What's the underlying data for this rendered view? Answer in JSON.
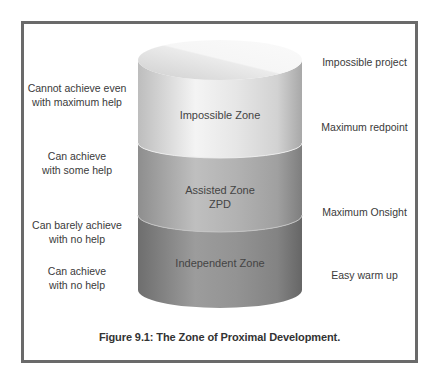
{
  "figure": {
    "caption": "Figure 9.1: The Zone of Proximal Development."
  },
  "cylinder": {
    "zones": [
      {
        "name": "Impossible Zone",
        "color_top": "#f2f2f2",
        "color_body": "#d9d9d9"
      },
      {
        "name": "Assisted Zone\nZPD",
        "color_body": "#a8a8a8"
      },
      {
        "name": "Independent Zone",
        "color_body": "#8c8c8c"
      }
    ]
  },
  "left_labels": [
    "Cannot achieve even\nwith maximum help",
    "Can achieve\nwith some help",
    "Can barely achieve\nwith no help",
    "Can achieve\nwith no help"
  ],
  "right_labels": [
    "Impossible project",
    "Maximum redpoint",
    "Maximum Onsight",
    "Easy warm up"
  ]
}
